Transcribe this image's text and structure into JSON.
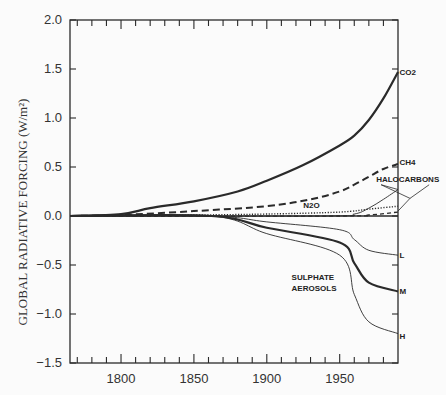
{
  "chart_data": {
    "type": "line",
    "title": "",
    "xlabel": "",
    "ylabel": "GLOBAL RADIATIVE FORCING (W/m²)",
    "xlim": [
      1765,
      1990
    ],
    "ylim": [
      -1.5,
      2.0
    ],
    "grid": false,
    "legend": "inline labels at right edge",
    "xticks": [
      1800,
      1850,
      1900,
      1950
    ],
    "xtick_labels": [
      "1800",
      "1850",
      "1900",
      "1950"
    ],
    "yticks": [
      2.0,
      1.5,
      1.0,
      0.5,
      0.0,
      -0.5,
      -1.0,
      -1.5
    ],
    "ytick_labels": [
      "2.0",
      "1.5",
      "1.0",
      "0.5",
      "0.0",
      "−0.5",
      "−1.0",
      "−1.5"
    ],
    "series": [
      {
        "name": "CO2",
        "style": "solid-thick",
        "x": [
          1765,
          1800,
          1820,
          1850,
          1880,
          1900,
          1925,
          1950,
          1960,
          1970,
          1980,
          1990
        ],
        "values": [
          0.0,
          0.02,
          0.08,
          0.15,
          0.25,
          0.36,
          0.52,
          0.72,
          0.82,
          0.98,
          1.2,
          1.47
        ]
      },
      {
        "name": "CH4",
        "style": "dashed-thick",
        "x": [
          1765,
          1800,
          1850,
          1900,
          1930,
          1950,
          1960,
          1970,
          1980,
          1990
        ],
        "values": [
          0.0,
          0.01,
          0.05,
          0.1,
          0.17,
          0.25,
          0.32,
          0.4,
          0.48,
          0.53
        ]
      },
      {
        "name": "N2O",
        "style": "dotted",
        "x": [
          1765,
          1850,
          1900,
          1950,
          1970,
          1990
        ],
        "values": [
          0.0,
          0.01,
          0.02,
          0.04,
          0.07,
          0.1
        ]
      },
      {
        "name": "HALOCARBONS",
        "style": "solid-thin",
        "x": [
          1765,
          1940,
          1960,
          1970,
          1980,
          1990
        ],
        "values": [
          0.0,
          0.0,
          0.02,
          0.08,
          0.17,
          0.27
        ]
      },
      {
        "name": "HALOCARBONS (2)",
        "style": "dashed-thin",
        "x": [
          1765,
          1950,
          1970,
          1990
        ],
        "values": [
          0.0,
          0.0,
          0.01,
          0.04
        ]
      },
      {
        "name": "SULPHATE AEROSOLS L",
        "style": "solid-thin",
        "x": [
          1765,
          1862,
          1900,
          1950,
          1960,
          1970,
          1990
        ],
        "values": [
          0.0,
          0.0,
          -0.06,
          -0.14,
          -0.24,
          -0.35,
          -0.4
        ]
      },
      {
        "name": "SULPHATE AEROSOLS M",
        "style": "solid-thick",
        "x": [
          1765,
          1862,
          1900,
          1950,
          1960,
          1970,
          1990
        ],
        "values": [
          0.0,
          0.0,
          -0.12,
          -0.27,
          -0.48,
          -0.68,
          -0.77
        ]
      },
      {
        "name": "SULPHATE AEROSOLS H",
        "style": "solid-thin",
        "x": [
          1765,
          1862,
          1900,
          1950,
          1960,
          1970,
          1990
        ],
        "values": [
          0.0,
          0.0,
          -0.18,
          -0.4,
          -0.8,
          -1.08,
          -1.2
        ]
      }
    ],
    "annotations": [
      {
        "text": "CO2",
        "x": 1991,
        "y": 1.47
      },
      {
        "text": "CH4",
        "x": 1991,
        "y": 0.55
      },
      {
        "text": "HALOCARBONS",
        "x": 1975,
        "y": 0.38
      },
      {
        "text": "N2O",
        "x": 1925,
        "y": 0.11
      },
      {
        "text": "L",
        "x": 1991,
        "y": -0.4
      },
      {
        "text": "M",
        "x": 1991,
        "y": -0.77
      },
      {
        "text": "H",
        "x": 1991,
        "y": -1.22
      },
      {
        "text": "SULPHATE",
        "x": 1917,
        "y": -0.62
      },
      {
        "text": "AEROSOLS",
        "x": 1917,
        "y": -0.73
      }
    ]
  },
  "labels": {
    "ylabel": "GLOBAL RADIATIVE FORCING (W/m²)"
  }
}
